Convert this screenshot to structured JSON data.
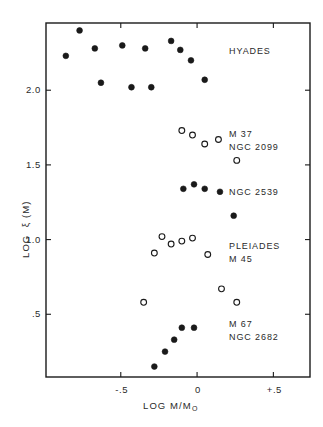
{
  "figure": {
    "background_color": "#ffffff",
    "ink_color": "#1a1a1a",
    "frame": {
      "left": 46,
      "top": 23,
      "right": 310,
      "bottom": 377
    }
  },
  "axes": {
    "x": {
      "title": "LOG M/M",
      "title_subscript": "O",
      "ticks": [
        {
          "label": "-.5",
          "value": -0.5
        },
        {
          "label": "0",
          "value": 0.0
        },
        {
          "label": "+.5",
          "value": 0.5
        }
      ],
      "range": [
        -0.99,
        0.74
      ]
    },
    "y": {
      "title": "LOG  ξ (M)",
      "ticks": [
        {
          "label": "2.0",
          "value": 2.0
        },
        {
          "label": "1.5",
          "value": 1.5
        },
        {
          "label": "1.0",
          "value": 1.0
        },
        {
          "label": ".5",
          "value": 0.5
        }
      ],
      "range": [
        0.08,
        2.45
      ]
    }
  },
  "annotations": [
    {
      "name": "hyades",
      "lines": [
        "HYADES"
      ],
      "x": 229,
      "y": 46
    },
    {
      "name": "m37",
      "lines": [
        "M 37",
        "NGC 2099"
      ],
      "x": 229,
      "y": 129
    },
    {
      "name": "ngc2539",
      "lines": [
        "NGC 2539"
      ],
      "x": 229,
      "y": 187
    },
    {
      "name": "pleiades",
      "lines": [
        "PLEIADES",
        "M 45"
      ],
      "x": 229,
      "y": 241
    },
    {
      "name": "m67",
      "lines": [
        "M 67",
        "NGC 2682"
      ],
      "x": 229,
      "y": 319
    }
  ],
  "chart_data": {
    "type": "scatter",
    "title": "",
    "xlabel": "LOG M/M☉",
    "ylabel": "LOG ξ (M)",
    "xlim": [
      -0.99,
      0.74
    ],
    "ylim": [
      0.08,
      2.45
    ],
    "grid": false,
    "legend": "inline-annotations",
    "xticks": [
      -0.5,
      0.0,
      0.5
    ],
    "xticklabels": [
      "-.5",
      "0",
      "+.5"
    ],
    "yticks": [
      2.0,
      1.5,
      1.0,
      0.5
    ],
    "yticklabels": [
      "2.0",
      "1.5",
      "1.0",
      ".5"
    ],
    "series": [
      {
        "name": "HYADES",
        "marker": "filled-circle",
        "color": "#1a1a1a",
        "points": [
          {
            "x": -0.86,
            "y": 2.23
          },
          {
            "x": -0.77,
            "y": 2.4
          },
          {
            "x": -0.67,
            "y": 2.28
          },
          {
            "x": -0.63,
            "y": 2.05
          },
          {
            "x": -0.49,
            "y": 2.3
          },
          {
            "x": -0.43,
            "y": 2.02
          },
          {
            "x": -0.34,
            "y": 2.28
          },
          {
            "x": -0.3,
            "y": 2.02
          },
          {
            "x": -0.17,
            "y": 2.33
          },
          {
            "x": -0.11,
            "y": 2.27
          },
          {
            "x": -0.04,
            "y": 2.2
          },
          {
            "x": 0.05,
            "y": 2.07
          }
        ]
      },
      {
        "name": "M 37 / NGC 2099",
        "marker": "open-circle",
        "color": "#1a1a1a",
        "points": [
          {
            "x": -0.1,
            "y": 1.73
          },
          {
            "x": -0.03,
            "y": 1.7
          },
          {
            "x": 0.05,
            "y": 1.64
          },
          {
            "x": 0.14,
            "y": 1.67
          },
          {
            "x": 0.26,
            "y": 1.53
          }
        ]
      },
      {
        "name": "NGC 2539",
        "marker": "filled-circle",
        "color": "#1a1a1a",
        "points": [
          {
            "x": -0.09,
            "y": 1.34
          },
          {
            "x": -0.02,
            "y": 1.37
          },
          {
            "x": 0.05,
            "y": 1.34
          },
          {
            "x": 0.15,
            "y": 1.32
          },
          {
            "x": 0.24,
            "y": 1.16
          }
        ]
      },
      {
        "name": "PLEIADES / M 45",
        "marker": "open-circle",
        "color": "#1a1a1a",
        "points": [
          {
            "x": -0.23,
            "y": 1.02
          },
          {
            "x": -0.17,
            "y": 0.97
          },
          {
            "x": -0.1,
            "y": 0.99
          },
          {
            "x": -0.03,
            "y": 1.01
          },
          {
            "x": -0.28,
            "y": 0.91
          },
          {
            "x": 0.07,
            "y": 0.9
          },
          {
            "x": -0.35,
            "y": 0.58
          },
          {
            "x": 0.16,
            "y": 0.67
          },
          {
            "x": 0.26,
            "y": 0.58
          }
        ]
      },
      {
        "name": "M 67 / NGC 2682",
        "marker": "filled-circle",
        "color": "#1a1a1a",
        "points": [
          {
            "x": -0.1,
            "y": 0.41
          },
          {
            "x": -0.02,
            "y": 0.41
          },
          {
            "x": -0.15,
            "y": 0.33
          },
          {
            "x": -0.21,
            "y": 0.25
          },
          {
            "x": -0.28,
            "y": 0.15
          }
        ]
      }
    ]
  }
}
